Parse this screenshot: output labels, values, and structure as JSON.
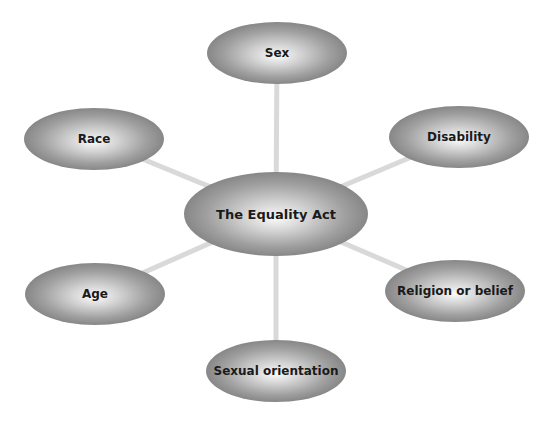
{
  "diagram": {
    "title": "The Equality Act",
    "center": {
      "id": "equality-act",
      "label": "The Equality Act"
    },
    "nodes": [
      {
        "id": "sex",
        "label": "Sex",
        "position": "top"
      },
      {
        "id": "disability",
        "label": "Disability",
        "position": "upper-right"
      },
      {
        "id": "religion",
        "label": "Religion or belief",
        "position": "lower-right"
      },
      {
        "id": "sexual-orientation",
        "label": "Sexual orientation",
        "position": "bottom"
      },
      {
        "id": "age",
        "label": "Age",
        "position": "lower-left"
      },
      {
        "id": "race",
        "label": "Race",
        "position": "upper-left"
      }
    ],
    "colors": {
      "ellipse_center": "#fafafa",
      "ellipse_edge": "#878787",
      "connector": "#d9d9d9",
      "text": "#1a1a1a"
    }
  }
}
